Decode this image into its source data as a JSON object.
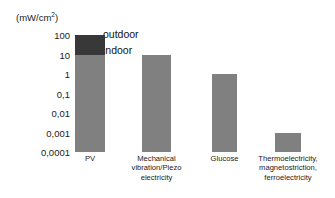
{
  "chart_data": {
    "type": "bar",
    "title": "",
    "xlabel": "",
    "ylabel": "(mW/cm2)",
    "ylim": [
      0.0001,
      100
    ],
    "yscale": "log",
    "grid": false,
    "legend_position": "inside-top-left",
    "ytick_labels": [
      "100",
      "10",
      "1",
      "0,1",
      "0,01",
      "0,001",
      "0,0001"
    ],
    "ytick_values": [
      100,
      10,
      1,
      0.1,
      0.01,
      0.001,
      0.0001
    ],
    "categories": [
      "PV",
      "Mechanical vibration/Piezo electricity",
      "Glucose",
      "Thermoelectricity, magnetostriction, ferroelectricity"
    ],
    "series": [
      {
        "name": "indoor",
        "values": [
          10,
          10,
          1,
          0.001
        ],
        "color": "#808080"
      },
      {
        "name": "outdoor",
        "values": [
          100,
          null,
          null,
          null
        ],
        "color": "#383838"
      }
    ],
    "annotations": [
      {
        "text": "outdoor",
        "target": "pv-outdoor-segment"
      },
      {
        "text": "indoor",
        "target": "pv-indoor-segment"
      }
    ]
  },
  "axis": {
    "unit_caption": "(mW/cm",
    "unit_caption_sup": "2",
    "unit_caption_tail": ")",
    "ticks": [
      {
        "label": "100",
        "value": 100
      },
      {
        "label": "10",
        "value": 10
      },
      {
        "label": "1",
        "value": 1
      },
      {
        "label": "0,1",
        "value": 0.1
      },
      {
        "label": "0,01",
        "value": 0.01
      },
      {
        "label": "0,001",
        "value": 0.001
      },
      {
        "label": "0,0001",
        "value": 0.0001
      }
    ]
  },
  "bars": [
    {
      "name": "pv",
      "category_lines": [
        "PV"
      ],
      "indoor_value": 10,
      "outdoor_value": 100
    },
    {
      "name": "mechanical-vibration",
      "category_lines": [
        "Mechanical",
        "vibration/Piezo",
        "electricity"
      ],
      "indoor_value": 10,
      "outdoor_value": null
    },
    {
      "name": "glucose",
      "category_lines": [
        "Glucose"
      ],
      "indoor_value": 1,
      "outdoor_value": null
    },
    {
      "name": "thermoelectricity",
      "category_lines": [
        "Thermoelectricity,",
        "magnetostriction,",
        "ferroelectricity"
      ],
      "indoor_value": 0.001,
      "outdoor_value": null
    }
  ],
  "legend": {
    "outdoor_label": "outdoor",
    "indoor_label": "indoor"
  },
  "colors": {
    "indoor": "#808080",
    "outdoor": "#383838",
    "text": "#1a1a1a",
    "background": "#ffffff"
  }
}
